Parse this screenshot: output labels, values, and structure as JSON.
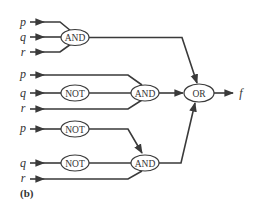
{
  "diagram": {
    "type": "logic-circuit",
    "caption": "(b)",
    "output": "f",
    "colors": {
      "line": "#3a3a3a",
      "text": "#333333",
      "background": "#ffffff"
    },
    "inputs": {
      "group1": [
        "p",
        "q",
        "r"
      ],
      "group2": [
        "p",
        "q",
        "r"
      ],
      "group3": [
        "p",
        "q",
        "r"
      ]
    },
    "gates": {
      "and1": "AND",
      "not1": "NOT",
      "and2": "AND",
      "or1": "OR",
      "not2": "NOT",
      "not3": "NOT",
      "and3": "AND"
    },
    "connections": [
      "group1: p, q, r -> AND (top)",
      "group2: p -> AND (middle)",
      "group2: q -> NOT -> AND (middle)",
      "group2: r -> AND (middle)",
      "group3: p -> NOT -> AND (bottom)",
      "group3: q -> NOT -> AND (bottom)",
      "group3: r -> AND (bottom)",
      "AND (top), AND (middle), AND (bottom) -> OR -> f"
    ]
  }
}
